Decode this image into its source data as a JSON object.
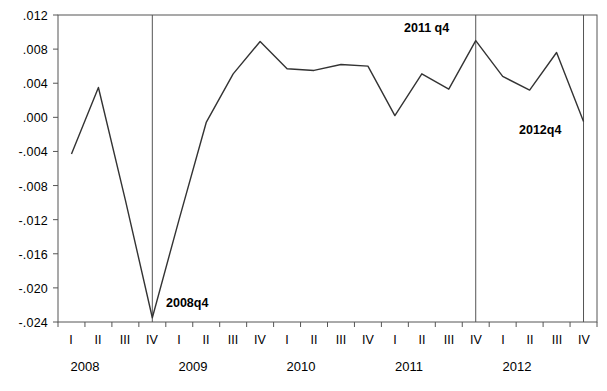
{
  "chart_data": {
    "type": "line",
    "title": "",
    "xlabel": "",
    "ylabel": "",
    "ylim": [
      -0.024,
      0.012
    ],
    "ytick_values": [
      0.012,
      0.008,
      0.004,
      0.0,
      -0.004,
      -0.008,
      -0.012,
      -0.016,
      -0.02,
      -0.024
    ],
    "ytick_labels": [
      ".012",
      ".008",
      ".004",
      ".000",
      "-.004",
      "-.008",
      "-.012",
      "-.016",
      "-.020",
      "-.024"
    ],
    "grid": false,
    "legend": null,
    "x_quarter_labels": [
      "I",
      "II",
      "III",
      "IV",
      "I",
      "II",
      "III",
      "IV",
      "I",
      "II",
      "III",
      "IV",
      "I",
      "II",
      "III",
      "IV",
      "I",
      "II",
      "III",
      "IV"
    ],
    "x_year_labels": [
      "2008",
      "2009",
      "2010",
      "2011",
      "2012"
    ],
    "categories": [
      "2008q1",
      "2008q2",
      "2008q3",
      "2008q4",
      "2009q1",
      "2009q2",
      "2009q3",
      "2009q4",
      "2010q1",
      "2010q2",
      "2010q3",
      "2010q4",
      "2011q1",
      "2011q2",
      "2011q3",
      "2011q4",
      "2012q1",
      "2012q2",
      "2012q3",
      "2012q4"
    ],
    "values": [
      -0.0043,
      0.0035,
      -0.0097,
      -0.0235,
      -0.0119,
      -0.0006,
      0.0051,
      0.0089,
      0.0057,
      0.0055,
      0.0062,
      0.006,
      0.0002,
      0.0051,
      0.0033,
      0.009,
      0.0048,
      0.0032,
      0.0076,
      -0.0005
    ],
    "annotations": [
      {
        "text": "2008q4",
        "category": "2008q4",
        "value": -0.0235
      },
      {
        "text": "2011 q4",
        "category": "2011q4",
        "value": 0.009
      },
      {
        "text": "2012q4",
        "category": "2012q4",
        "value": -0.0005
      }
    ],
    "vertical_lines": [
      "2008q4",
      "2011q4",
      "2012q4"
    ],
    "series_color": "#333333",
    "axis_color": "#555555"
  }
}
